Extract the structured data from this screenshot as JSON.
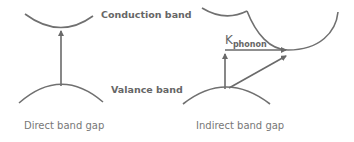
{
  "labels": {
    "conduction_band": "Conduction band",
    "valance_band": "Valance band",
    "k_main": "K",
    "k_sub": "phonon",
    "direct_caption": "Direct band gap",
    "indirect_caption": "Indirect band gap"
  },
  "colors": {
    "curve": "#707070",
    "text": "#6e6e6e"
  }
}
